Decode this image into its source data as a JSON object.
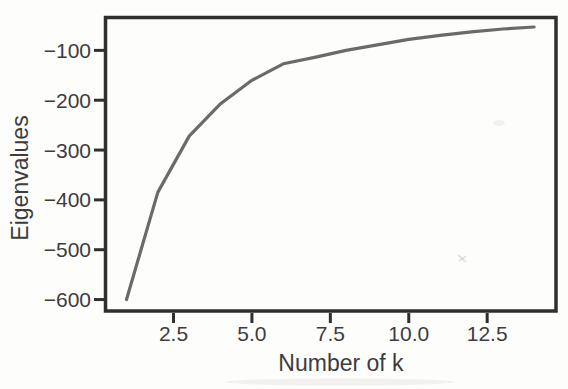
{
  "chart_data": {
    "type": "line",
    "title": "",
    "xlabel": "Number of k",
    "ylabel": "Eigenvalues",
    "x": [
      1,
      2,
      3,
      4,
      5,
      6,
      7,
      8,
      9,
      10,
      11,
      12,
      13,
      14
    ],
    "y": [
      -600,
      -385,
      -272,
      -207,
      -160,
      -127,
      -114,
      -100,
      -89,
      -78,
      -70,
      -63,
      -57,
      -53
    ],
    "xlim": [
      0.3,
      14.71
    ],
    "ylim": [
      -625,
      -31
    ],
    "xticks": {
      "values": [
        2.5,
        5.0,
        7.5,
        10.0,
        12.5
      ],
      "labels": [
        "2.5",
        "5.0",
        "7.5",
        "10.0",
        "12.5"
      ]
    },
    "yticks": {
      "values": [
        -100,
        -200,
        -300,
        -400,
        -500,
        -600
      ],
      "labels": [
        "−100",
        "−200",
        "−300",
        "−400",
        "−500",
        "−600"
      ]
    },
    "grid": false,
    "legend": null,
    "colors": {
      "line": "#6a6a6a",
      "spine": "#2f2f2f",
      "text": "#3c3c3c",
      "background": "#fdfdfc"
    }
  }
}
